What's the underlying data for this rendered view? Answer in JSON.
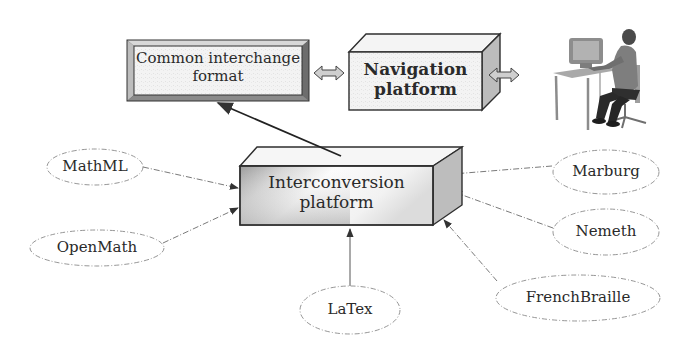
{
  "diagram": {
    "type": "architecture-flow",
    "nodes": {
      "common_format": {
        "line1": "Common interchange",
        "line2": "format",
        "shape": "beveled-box"
      },
      "navigation": {
        "line1": "Navigation",
        "line2": "platform",
        "shape": "3d-box",
        "bold": true
      },
      "interconversion": {
        "line1": "Interconversion",
        "line2": "platform",
        "shape": "3d-box-gradient"
      },
      "user": {
        "label": "person-at-computer",
        "shape": "illustration"
      },
      "mathml": {
        "label": "MathML",
        "shape": "ellipse"
      },
      "openmath": {
        "label": "OpenMath",
        "shape": "ellipse"
      },
      "latex": {
        "label": "LaTex",
        "shape": "ellipse"
      },
      "marburg": {
        "label": "Marburg",
        "shape": "ellipse"
      },
      "nemeth": {
        "label": "Nemeth",
        "shape": "ellipse"
      },
      "frenchbraille": {
        "label": "FrenchBraille",
        "shape": "ellipse"
      }
    },
    "edges": [
      {
        "from": "interconversion",
        "to": "common_format",
        "style": "solid-arrow"
      },
      {
        "from": "common_format",
        "to": "navigation",
        "style": "double-arrow"
      },
      {
        "from": "navigation",
        "to": "user",
        "style": "double-arrow"
      },
      {
        "from": "mathml",
        "to": "interconversion",
        "style": "dashed-arrow"
      },
      {
        "from": "openmath",
        "to": "interconversion",
        "style": "dashed-arrow"
      },
      {
        "from": "latex",
        "to": "interconversion",
        "style": "solid-arrow"
      },
      {
        "from": "marburg",
        "to": "interconversion",
        "style": "dashed-arrow"
      },
      {
        "from": "nemeth",
        "to": "interconversion",
        "style": "dashed-arrow"
      },
      {
        "from": "frenchbraille",
        "to": "interconversion",
        "style": "dashed-arrow"
      }
    ],
    "colors": {
      "box_fill": "#f2f2f2",
      "box_side": "#b8b8b8",
      "box_edge": "#2e2e2e",
      "ellipse_stroke": "#8a8a8a",
      "arrow": "#333333",
      "double_arrow_fill": "#c8c8c8"
    }
  }
}
